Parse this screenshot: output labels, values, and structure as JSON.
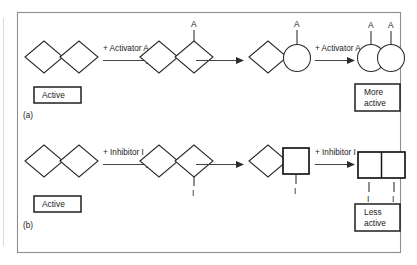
{
  "figure": {
    "caption_a": "(a)",
    "caption_b": "(b)",
    "panel_a": {
      "id": "activation",
      "arrow1_label": "+ Activator A",
      "arrow3_label": "+ Activator A",
      "start_state_label": "Active",
      "end_state_label_line1": "More",
      "end_state_label_line2": "active",
      "ligand_symbol": "A",
      "ligand_count_step2": 1,
      "ligand_count_step3": 1,
      "ligand_count_step4": 2,
      "subunit_shapes": [
        "diamond",
        "diamond",
        "circle",
        "circle"
      ],
      "steps": [
        {
          "index": 1,
          "shapes": [
            "diamond",
            "diamond"
          ],
          "ligands": 0
        },
        {
          "index": 2,
          "shapes": [
            "diamond",
            "diamond"
          ],
          "ligands": 1
        },
        {
          "index": 3,
          "shapes": [
            "diamond",
            "circle"
          ],
          "ligands": 1
        },
        {
          "index": 4,
          "shapes": [
            "circle",
            "circle"
          ],
          "ligands": 2
        }
      ]
    },
    "panel_b": {
      "id": "inhibition",
      "arrow1_label": "+ Inhibitor I",
      "arrow3_label": "+ Inhibitor I",
      "start_state_label": "Active",
      "end_state_label_line1": "Less",
      "end_state_label_line2": "active",
      "ligand_symbol": "I",
      "ligand_count_step2": 1,
      "ligand_count_step3": 1,
      "ligand_count_step4": 2,
      "subunit_shapes": [
        "diamond",
        "diamond",
        "square",
        "square"
      ],
      "steps": [
        {
          "index": 1,
          "shapes": [
            "diamond",
            "diamond"
          ],
          "ligands": 0
        },
        {
          "index": 2,
          "shapes": [
            "diamond",
            "diamond"
          ],
          "ligands": 1
        },
        {
          "index": 3,
          "shapes": [
            "diamond",
            "square"
          ],
          "ligands": 1
        },
        {
          "index": 4,
          "shapes": [
            "square",
            "square"
          ],
          "ligands": 2
        }
      ]
    },
    "colors": {
      "stroke": "#2b2b2b",
      "bold_stroke": "#171717",
      "border": "#8e8e8e",
      "background": "#ffffff",
      "arrow": "#3a3a3a"
    }
  }
}
